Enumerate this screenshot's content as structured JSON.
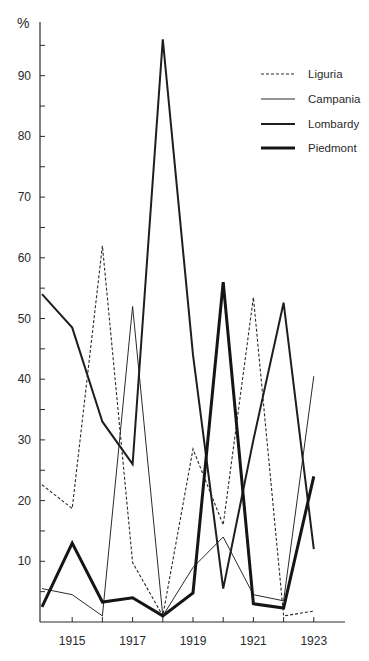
{
  "chart_data": {
    "type": "line",
    "title": "",
    "xlabel": "",
    "ylabel": "%",
    "ylim": [
      0,
      97
    ],
    "xlim": [
      1914,
      1924
    ],
    "grid": false,
    "legend_position": "upper right",
    "x": [
      1914,
      1915,
      1916,
      1917,
      1918,
      1919,
      1920,
      1921,
      1922,
      1923
    ],
    "x_tick_labels": [
      "1915",
      "1917",
      "1919",
      "1921",
      "1923"
    ],
    "x_tick_labeled_years": [
      1915,
      1917,
      1919,
      1921,
      1923
    ],
    "x_minor_ticks": [
      1915,
      1916,
      1917,
      1918,
      1919,
      1920,
      1921,
      1922,
      1923
    ],
    "y_tick_labels": [
      "10",
      "20",
      "30",
      "40",
      "50",
      "60",
      "70",
      "80",
      "90"
    ],
    "y_tick_values": [
      10,
      20,
      30,
      40,
      50,
      60,
      70,
      80,
      90
    ],
    "y_minor_ticks": [
      5,
      15,
      25,
      35,
      45,
      55,
      65,
      75,
      85,
      95
    ],
    "series": [
      {
        "name": "Liguria",
        "style": "dashed",
        "stroke_width": 1.1,
        "color": "#2a2a2a",
        "values": [
          22.6,
          18.7,
          62,
          9.8,
          1,
          28.5,
          16,
          53.5,
          1,
          1.8
        ]
      },
      {
        "name": "Campania",
        "style": "solid-thin",
        "stroke_width": 1.0,
        "color": "#2a2a2a",
        "values": [
          5.5,
          4.5,
          1,
          52,
          1,
          9,
          14,
          4.5,
          3.5,
          40.5
        ]
      },
      {
        "name": "Lombardy",
        "style": "solid-medium",
        "stroke_width": 2.0,
        "color": "#1e1e1e",
        "values": [
          54,
          48.5,
          33,
          26,
          96,
          44,
          5.5,
          30,
          52.6,
          12
        ]
      },
      {
        "name": "Piedmont",
        "style": "solid-thick",
        "stroke_width": 3.0,
        "color": "#151515",
        "values": [
          2.5,
          13,
          3.3,
          4,
          1,
          4.8,
          56,
          3,
          2.3,
          24
        ]
      }
    ]
  },
  "axis": {
    "unit_label": "%"
  },
  "legend": {
    "items": [
      {
        "label": "Liguria",
        "style": "dashed"
      },
      {
        "label": "Campania",
        "style": "solid-thin"
      },
      {
        "label": "Lombardy",
        "style": "solid-medium"
      },
      {
        "label": "Piedmont",
        "style": "solid-thick"
      }
    ]
  }
}
